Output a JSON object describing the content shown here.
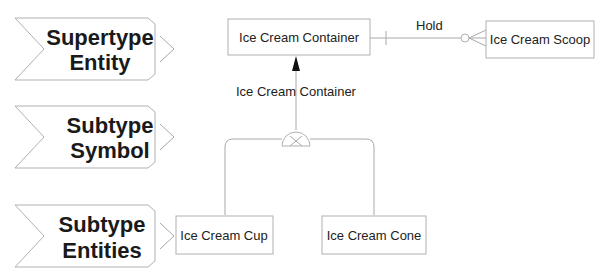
{
  "legend": {
    "items": [
      {
        "line1": "Supertype",
        "line2": "Entity"
      },
      {
        "line1": "Subtype",
        "line2": "Symbol"
      },
      {
        "line1": "Subtype",
        "line2": "Entities"
      }
    ]
  },
  "entities": {
    "supertype": "Ice Cream Container",
    "related": "Ice Cream Scoop",
    "subtypes": [
      "Ice Cream Cup",
      "Ice Cream Cone"
    ]
  },
  "relationships": {
    "hold": "Hold",
    "discriminator": "Ice Cream Container"
  },
  "colors": {
    "line": "#a8a8a8",
    "text": "#1a1a1a"
  }
}
